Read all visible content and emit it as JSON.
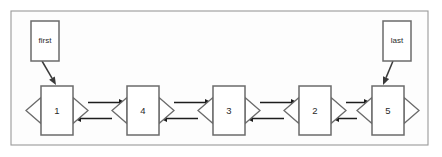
{
  "diagram": {
    "kind": "doubly-linked-list",
    "frame": {
      "x": 11,
      "y": 11,
      "width": 417,
      "height": 134
    },
    "geometry": {
      "node_width": 32,
      "node_height": 49,
      "node_top": 86,
      "node_centers_y": 110.5,
      "tri_width": 15,
      "tri_height": 26,
      "pointer_box_width": 28,
      "pointer_box_height": 40
    },
    "nodes": [
      {
        "id": "node-1",
        "label": "1",
        "x": 41
      },
      {
        "id": "node-4",
        "label": "4",
        "x": 127
      },
      {
        "id": "node-3",
        "label": "3",
        "x": 213
      },
      {
        "id": "node-2",
        "label": "2",
        "x": 299
      },
      {
        "id": "node-5",
        "label": "5",
        "x": 372
      }
    ],
    "pointers": [
      {
        "id": "pointer-first",
        "label": "first",
        "box_x": 31,
        "box_y": 21,
        "target": "node-1",
        "arrow_from_x": 42,
        "arrow_from_y": 61,
        "arrow_to_x": 56,
        "arrow_to_y": 85
      },
      {
        "id": "pointer-last",
        "label": "last",
        "box_x": 383,
        "box_y": 21,
        "target": "node-5",
        "arrow_from_x": 393,
        "arrow_from_y": 61,
        "arrow_to_x": 383,
        "arrow_to_y": 85
      }
    ],
    "links": [
      {
        "id": "link-1-4",
        "from": "node-1",
        "to": "node-4"
      },
      {
        "id": "link-4-3",
        "from": "node-4",
        "to": "node-3"
      },
      {
        "id": "link-3-2",
        "from": "node-3",
        "to": "node-2"
      },
      {
        "id": "link-2-5",
        "from": "node-2",
        "to": "node-5"
      }
    ],
    "terminators": [
      {
        "id": "terminator-head",
        "attached_to": "node-1",
        "side": "left",
        "direction": "left"
      },
      {
        "id": "terminator-tail",
        "attached_to": "node-5",
        "side": "right",
        "direction": "right"
      }
    ],
    "colors": {
      "frame_stroke": "#9a9a9a",
      "node_stroke": "#6b6b6b",
      "link_stroke": "#1d1d1d",
      "pointer_stroke": "#3a3a3a",
      "text": "#2a2a2a",
      "background": "#ffffff"
    }
  }
}
